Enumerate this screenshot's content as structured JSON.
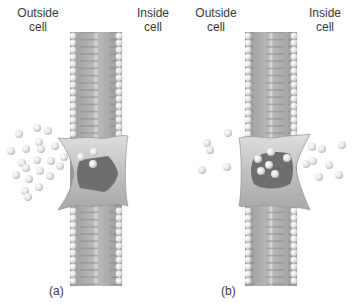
{
  "panels": [
    {
      "id": "a",
      "label": "(a)",
      "outside_label": "Outside\ncell",
      "inside_label": "Inside\ncell",
      "outside_text_1": "Outside",
      "outside_text_2": "cell",
      "inside_text_1": "Inside",
      "inside_text_2": "cell",
      "state": "carrier protein open to outside, binding solute molecules",
      "bound_molecules": 3
    },
    {
      "id": "b",
      "label": "(b)",
      "outside_text_1": "Outside",
      "outside_text_2": "cell",
      "inside_text_1": "Inside",
      "inside_text_2": "cell",
      "state": "carrier protein open to inside, releasing solute molecules",
      "bound_molecules": 6
    }
  ],
  "colors": {
    "membrane": "#a8a8a8",
    "membrane_dark": "#8c8c8c",
    "head": "#d8d8d8",
    "protein": "#c4c4c4",
    "protein_cavity": "#6e6e6e",
    "molecule": "#e6e6e6",
    "text": "#3a3a3a"
  }
}
